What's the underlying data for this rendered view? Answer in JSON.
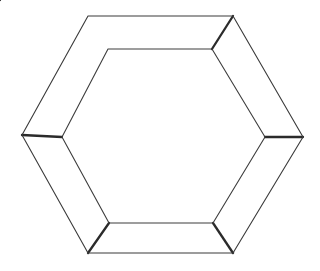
{
  "figure": {
    "background_color": "#ffffff",
    "canvas": {
      "width": 320,
      "height": 271
    },
    "stroke": {
      "outline_color": "#3a3a3a",
      "inner_color": "#3d3d3d",
      "connector_color": "#2b2b2b",
      "outline_width": 1.1,
      "inner_width": 1.1,
      "connector_width": 2.3
    },
    "fills": {
      "band_color": "#ffffff",
      "core_color": "#ffffff"
    },
    "outer_hexagon": {
      "name": "outer-hexagon",
      "vertex_count": 6,
      "points": "88,16 233,16 303,137 233,253 88,253 22,135",
      "vertices": [
        {
          "label": "top-left",
          "x": 88,
          "y": 16
        },
        {
          "label": "top-right",
          "x": 233,
          "y": 16
        },
        {
          "label": "right",
          "x": 303,
          "y": 137
        },
        {
          "label": "bottom-right",
          "x": 233,
          "y": 253
        },
        {
          "label": "bottom-left",
          "x": 88,
          "y": 253
        },
        {
          "label": "left",
          "x": 22,
          "y": 135
        }
      ]
    },
    "inner_hexagon": {
      "name": "inner-hexagon",
      "vertex_count": 6,
      "points": "108,49 212,49 265,137 213,223 109,223 62,137",
      "vertices": [
        {
          "label": "top-left",
          "x": 108,
          "y": 49
        },
        {
          "label": "top-right",
          "x": 212,
          "y": 49
        },
        {
          "label": "right",
          "x": 265,
          "y": 137
        },
        {
          "label": "bottom-right",
          "x": 213,
          "y": 223
        },
        {
          "label": "bottom-left",
          "x": 109,
          "y": 223
        },
        {
          "label": "left",
          "x": 62,
          "y": 137
        }
      ]
    },
    "connectors": [
      {
        "label": "top-left-connector",
        "x1": 88,
        "y1": 16,
        "x2": 108,
        "y2": 49
      },
      {
        "label": "top-right-connector",
        "x1": 233,
        "y1": 16,
        "x2": 212,
        "y2": 49
      },
      {
        "label": "right-connector",
        "x1": 303,
        "y1": 137,
        "x2": 265,
        "y2": 137
      },
      {
        "label": "bottom-right-connector",
        "x1": 233,
        "y1": 253,
        "x2": 213,
        "y2": 223
      },
      {
        "label": "bottom-left-connector",
        "x1": 88,
        "y1": 253,
        "x2": 109,
        "y2": 223
      },
      {
        "label": "left-connector",
        "x1": 22,
        "y1": 135,
        "x2": 62,
        "y2": 137
      }
    ]
  }
}
